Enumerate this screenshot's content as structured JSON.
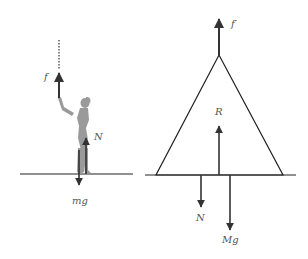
{
  "diagram": {
    "type": "free-body-diagram",
    "colors": {
      "line": "#222222",
      "arrow": "#333333",
      "figure": "#9a9a9a",
      "label": "#555555"
    },
    "left_panel": {
      "subject": "person-pulling-rope",
      "forces": [
        {
          "id": "f",
          "label": "f",
          "direction": "up"
        },
        {
          "id": "N",
          "label": "N",
          "direction": "up"
        },
        {
          "id": "mg",
          "label": "mg",
          "direction": "down"
        }
      ]
    },
    "right_panel": {
      "subject": "triangle-frame",
      "forces": [
        {
          "id": "f_prime",
          "label": "f′",
          "direction": "up"
        },
        {
          "id": "R",
          "label": "R",
          "direction": "up"
        },
        {
          "id": "N",
          "label": "N",
          "direction": "down"
        },
        {
          "id": "Mg",
          "label": "Mg",
          "direction": "down"
        }
      ]
    }
  }
}
